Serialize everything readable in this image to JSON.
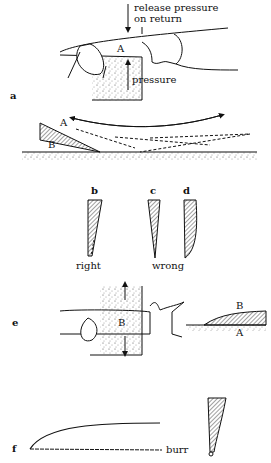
{
  "figure": {
    "panels": [
      {
        "id": "a",
        "label": "a",
        "annotations": [
          "release pressure",
          "on return",
          "A",
          "pressure"
        ]
      },
      {
        "id": "a2",
        "annotations": [
          "A",
          "B"
        ]
      },
      {
        "id": "bcd",
        "sub_labels": [
          "b",
          "c",
          "d"
        ],
        "captions": [
          "right",
          "wrong"
        ]
      },
      {
        "id": "e",
        "label": "e",
        "annotations": [
          "B",
          "B",
          "A"
        ]
      },
      {
        "id": "f",
        "label": "f",
        "annotations": [
          "burr"
        ]
      }
    ]
  },
  "text": {
    "release1": "release pressure",
    "release2": "on return",
    "A_a": "A",
    "pressure": "pressure",
    "fig_a": "a",
    "A_a2": "A",
    "B_a2": "B",
    "b": "b",
    "c": "c",
    "d": "d",
    "right": "right",
    "wrong": "wrong",
    "fig_e": "e",
    "B_e": "B",
    "B_e2": "B",
    "A_e2": "A",
    "fig_f": "f",
    "burr": "burr"
  },
  "colors": {
    "ink": "#111111",
    "paper": "#ffffff"
  }
}
